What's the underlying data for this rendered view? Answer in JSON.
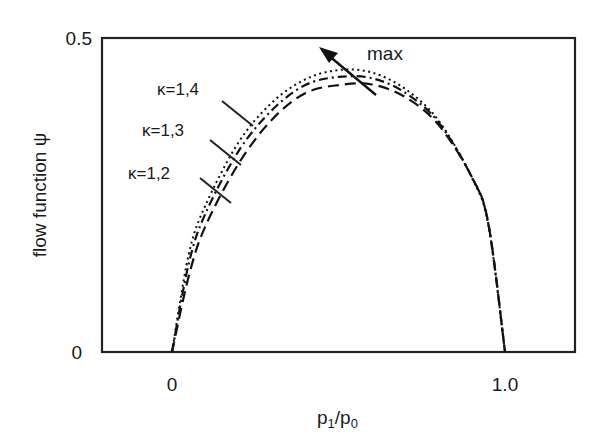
{
  "chart_data": {
    "type": "line",
    "title": "",
    "xlabel": "p1/p0",
    "ylabel": "flow function ψ",
    "xlim": [
      -0.21,
      1.21
    ],
    "ylim": [
      0,
      0.5
    ],
    "x_ticks": [
      "0",
      "1.0"
    ],
    "y_ticks": [
      "0",
      "0.5"
    ],
    "grid": false,
    "legend": "inline labels with leader lines",
    "x": [
      0,
      0.05,
      0.1,
      0.2,
      0.3,
      0.4,
      0.5,
      0.6,
      0.7,
      0.8,
      0.9,
      0.95,
      1.0
    ],
    "series": [
      {
        "name": "κ=1,4",
        "style": "dotted",
        "values": [
          0,
          0.155,
          0.233,
          0.334,
          0.397,
          0.434,
          0.449,
          0.445,
          0.419,
          0.369,
          0.278,
          0.202,
          0
        ]
      },
      {
        "name": "κ=1,3",
        "style": "dash-dot",
        "values": [
          0,
          0.14,
          0.22,
          0.32,
          0.385,
          0.425,
          0.438,
          0.436,
          0.413,
          0.366,
          0.279,
          0.204,
          0
        ]
      },
      {
        "name": "κ=1,2",
        "style": "dashed",
        "values": [
          0,
          0.12,
          0.2,
          0.3,
          0.37,
          0.412,
          0.425,
          0.426,
          0.406,
          0.362,
          0.279,
          0.205,
          0
        ]
      }
    ],
    "annotations": [
      {
        "text": "max",
        "type": "arrow",
        "description": "arrow pointing up-left through the curve maxima"
      }
    ]
  },
  "labels": {
    "y_axis": "flow function ψ",
    "x_axis_main": "p",
    "x_axis_sub1": "1",
    "x_axis_slash": "/p",
    "x_axis_sub0": "0",
    "y_tick_top": "0.5",
    "y_tick_bottom": "0",
    "x_tick_left": "0",
    "x_tick_right": "1.0",
    "kappa_14": "κ=1,4",
    "kappa_13": "κ=1,3",
    "kappa_12": "κ=1,2",
    "max": "max"
  }
}
